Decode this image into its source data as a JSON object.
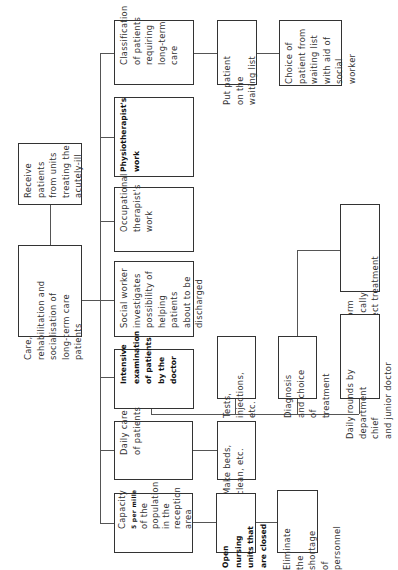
{
  "diagram": {
    "type": "organizational-flow",
    "orientation": "rotated-90-ccw",
    "root": {
      "id": "receive",
      "text": "Receive\npatients\nfrom units\ntreating the\nacutely-ill"
    },
    "core": {
      "id": "care",
      "text": "Care,\nrehabilitation and\nsocialisation of\nlong-term care\npatients"
    },
    "branches": [
      {
        "id": "classification",
        "text": "Classification\nof patients\nrequiring\nlong-term\ncare",
        "bold": false,
        "children": [
          {
            "id": "waiting-list",
            "text": "Put patient\non the\nwaiting list"
          },
          {
            "id": "choice",
            "text": "Choice of\npatient from\nwaiting list\nwith aid of\nsocial worker"
          }
        ]
      },
      {
        "id": "physiotherapist",
        "text": "Physiotherapist's\nwork",
        "bold": true
      },
      {
        "id": "occupational",
        "text": "Occupational\ntherapist's\nwork",
        "bold": false
      },
      {
        "id": "social-worker",
        "text": "Social worker\ninvestigates\npossibility of\nhelping patients\nabout to be\ndischarged",
        "bold": false
      },
      {
        "id": "intensive",
        "text": "Intensive\nexamination\nof patients\nby the\ndoctor",
        "bold": true,
        "children": [
          {
            "id": "tests",
            "text": "Tests,\ninjections,\netc."
          },
          {
            "id": "diagnosis",
            "text": "Diagnosis\nand choice\nof treatment",
            "children": [
              {
                "id": "perform",
                "text": "Perform\nmedically\ncorrect treatment"
              }
            ]
          },
          {
            "id": "daily-rounds",
            "text": "Daily rounds by\ndepartment chief\nand junior doctor"
          }
        ]
      },
      {
        "id": "daily-care",
        "text": "Daily care\nof patients",
        "bold": false,
        "children": [
          {
            "id": "make-beds",
            "text": "Make beds,\nclean, etc."
          }
        ]
      },
      {
        "id": "capacity",
        "text_line1": "Capacity",
        "text_bold": "5 per mille",
        "text_rest": "of the\npopulation\nin the\nreception\narea",
        "children": [
          {
            "id": "open-nursing",
            "text": "Open nursing\nunits that\nare closed",
            "bold": true
          },
          {
            "id": "eliminate",
            "text": "Eliminate\nthe shortage\nof personnel"
          }
        ]
      }
    ]
  }
}
